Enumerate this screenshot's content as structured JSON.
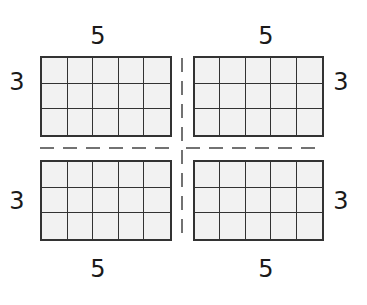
{
  "diagram": {
    "arrays": [
      {
        "id": "top-left",
        "rows": 3,
        "cols": 5,
        "row_label": "3",
        "col_label": "5",
        "row_label_side": "left",
        "col_label_side": "top"
      },
      {
        "id": "top-right",
        "rows": 3,
        "cols": 5,
        "row_label": "3",
        "col_label": "5",
        "row_label_side": "right",
        "col_label_side": "top"
      },
      {
        "id": "bottom-left",
        "rows": 3,
        "cols": 5,
        "row_label": "3",
        "col_label": "5",
        "row_label_side": "left",
        "col_label_side": "bottom"
      },
      {
        "id": "bottom-right",
        "rows": 3,
        "cols": 5,
        "row_label": "3",
        "col_label": "5",
        "row_label_side": "right",
        "col_label_side": "bottom"
      }
    ],
    "colors": {
      "stroke": "#333333",
      "cell_fill": "#f2f2f2",
      "text": "#1a1a1a"
    }
  }
}
